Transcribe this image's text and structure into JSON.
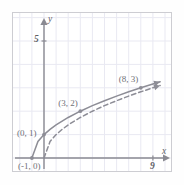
{
  "figure": {
    "kind": "cartesian-graph",
    "background": "#ffffff",
    "border_color": "#cdcdd2",
    "grid_color": "#e9e9f2",
    "axis_color": "#8a8a92",
    "curve_color": "#8d8d96",
    "label_color": "#6f6f77"
  },
  "axes": {
    "x_name": "x",
    "y_name": "y",
    "x_tick_label": "9",
    "y_tick_label": "5",
    "x_range": [
      -2,
      11
    ],
    "y_range": [
      -1,
      6
    ],
    "grid_step": 1,
    "grid": true,
    "x_axis_arrow": true,
    "y_axis_arrow": true
  },
  "annotations": [
    {
      "text": "(-1, 0)",
      "x": -1,
      "y": 0
    },
    {
      "text": "(0, 1)",
      "x": 0,
      "y": 1
    },
    {
      "text": "(3, 2)",
      "x": 3,
      "y": 2
    },
    {
      "text": "(8, 3)",
      "x": 8,
      "y": 3
    }
  ],
  "chart_data": {
    "type": "line",
    "title": "",
    "xlabel": "x",
    "ylabel": "y",
    "xlim": [
      -2,
      11
    ],
    "ylim": [
      -1,
      6
    ],
    "grid": true,
    "legend": "none",
    "series": [
      {
        "name": "y = sqrt(x+1)",
        "style": "solid",
        "arrow_end": true,
        "x": [
          -1,
          -0.5,
          0,
          0.5,
          1,
          2,
          3,
          4,
          5,
          6,
          7,
          8,
          9,
          9.6
        ],
        "values": [
          0,
          0.707,
          1,
          1.225,
          1.414,
          1.732,
          2,
          2.236,
          2.449,
          2.646,
          2.828,
          3,
          3.162,
          3.256
        ],
        "marked_points": [
          [
            -1,
            0
          ],
          [
            0,
            1
          ],
          [
            3,
            2
          ],
          [
            8,
            3
          ]
        ]
      },
      {
        "name": "y = sqrt(x)",
        "style": "dashed",
        "arrow_end": true,
        "x": [
          0,
          0.5,
          1,
          1.5,
          2,
          3,
          4,
          5,
          6,
          7,
          8,
          9,
          9.6
        ],
        "values": [
          0,
          0.707,
          1,
          1.225,
          1.414,
          1.732,
          2,
          2.236,
          2.449,
          2.646,
          2.828,
          3,
          3.098
        ],
        "marked_points": []
      }
    ]
  },
  "points_plot": {
    "x_tick_pos": 9,
    "y_tick_pos": 5
  }
}
